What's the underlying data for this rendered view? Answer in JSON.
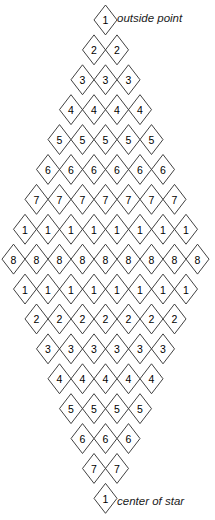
{
  "figure": {
    "geometry": {
      "apex_x": 105.5,
      "top_y": 5,
      "bottom_y": 513,
      "cell_width": 23.0,
      "cell_height": 29.9,
      "rows": 17,
      "max_cells_in_row": 9,
      "line_color": "#2b2b2b",
      "digit_color": "#000000",
      "background_color": "#ffffff"
    },
    "rows": [
      {
        "index": 1,
        "count": 1,
        "digit": "1"
      },
      {
        "index": 2,
        "count": 2,
        "digit": "2"
      },
      {
        "index": 3,
        "count": 3,
        "digit": "3"
      },
      {
        "index": 4,
        "count": 4,
        "digit": "4"
      },
      {
        "index": 5,
        "count": 5,
        "digit": "5"
      },
      {
        "index": 6,
        "count": 6,
        "digit": "6"
      },
      {
        "index": 7,
        "count": 7,
        "digit": "7"
      },
      {
        "index": 8,
        "count": 8,
        "digit": "1"
      },
      {
        "index": 9,
        "count": 9,
        "digit": "8"
      },
      {
        "index": 10,
        "count": 8,
        "digit": "1"
      },
      {
        "index": 11,
        "count": 7,
        "digit": "2"
      },
      {
        "index": 12,
        "count": 6,
        "digit": "3"
      },
      {
        "index": 13,
        "count": 5,
        "digit": "4"
      },
      {
        "index": 14,
        "count": 4,
        "digit": "5"
      },
      {
        "index": 15,
        "count": 3,
        "digit": "6"
      },
      {
        "index": 16,
        "count": 2,
        "digit": "7"
      },
      {
        "index": 17,
        "count": 1,
        "digit": "1"
      }
    ],
    "annotations": [
      {
        "id": "outside-point",
        "text": "outside point",
        "x": 117,
        "y": 18
      },
      {
        "id": "center-of-star",
        "text": "center of star",
        "x": 117,
        "y": 501
      }
    ]
  }
}
